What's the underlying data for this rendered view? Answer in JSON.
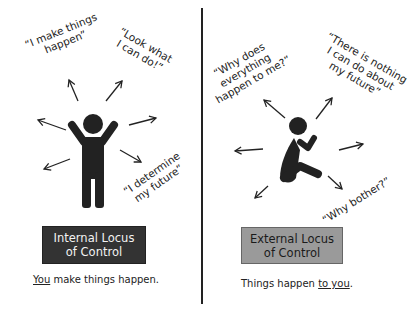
{
  "panels": {
    "internal": {
      "quotes": [
        "“I make things happen”",
        "“Look what I can do!”",
        "“I determine my future”"
      ],
      "quote_lines": {
        "q1_l1": "“I make things",
        "q1_l2": "happen”",
        "q2_l1": "“Look what",
        "q2_l2": "I can do!”",
        "q3_l1": "“I determine",
        "q3_l2": "my future”"
      },
      "figure": "person-arms-raised-icon",
      "label_line1": "Internal Locus",
      "label_line2": "of Control",
      "caption_emph": "You",
      "caption_rest": " make things happen.",
      "box_color": "#333333"
    },
    "external": {
      "quotes": [
        "“Why does everything happen to me?”",
        "“There is nothing I can do about my future”",
        "“Why bother?”"
      ],
      "quote_lines": {
        "q1_l1": "“Why does",
        "q1_l2": "everything",
        "q1_l3": "happen to me?”",
        "q2_l1": "“There is nothing",
        "q2_l2": "I can do about",
        "q2_l3": "my future”",
        "q3_l1": "“Why bother?”"
      },
      "figure": "person-sitting-hugging-knees-icon",
      "label_line1": "External Locus",
      "label_line2": "of Control",
      "caption_rest": "Things happen ",
      "caption_emph": "to you",
      "caption_end": ".",
      "box_color": "#9a9a9a"
    }
  }
}
